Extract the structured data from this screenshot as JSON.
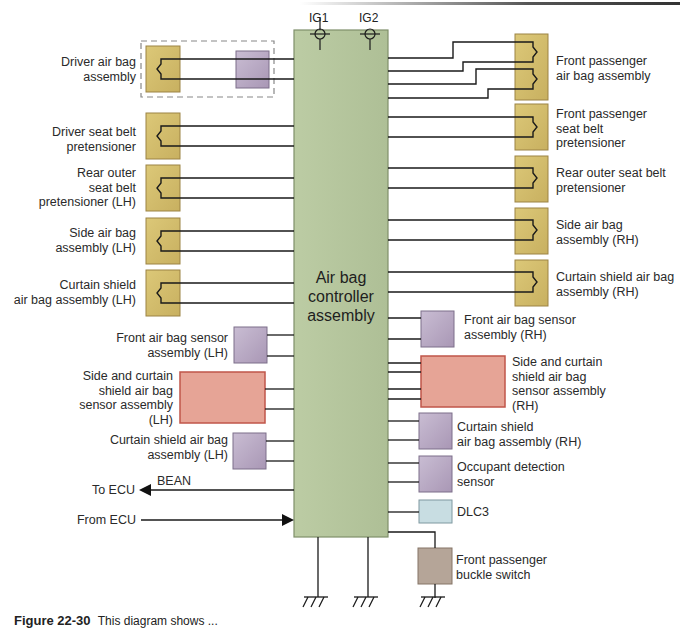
{
  "diagram": {
    "title": "Air bag controller assembly",
    "controller": {
      "label_lines": [
        "Air bag",
        "controller",
        "assembly"
      ],
      "color": "#b6c79d"
    },
    "power_inputs": [
      {
        "label": "IG1"
      },
      {
        "label": "IG2"
      }
    ],
    "left_components": [
      {
        "name": "driver-air-bag-assembly",
        "label_lines": [
          "Driver air bag",
          "assembly"
        ],
        "type": "squib",
        "note": "in dashed box with clock spring (purple)"
      },
      {
        "name": "driver-seat-belt-pretensioner",
        "label_lines": [
          "Driver seat belt",
          "pretensioner"
        ],
        "type": "squib"
      },
      {
        "name": "rear-outer-seat-belt-pretensioner-lh",
        "label_lines": [
          "Rear outer",
          "seat belt",
          "pretensioner (LH)"
        ],
        "type": "squib"
      },
      {
        "name": "side-air-bag-assembly-lh",
        "label_lines": [
          "Side air bag",
          "assembly (LH)"
        ],
        "type": "squib"
      },
      {
        "name": "curtain-shield-air-bag-assembly-lh",
        "label_lines": [
          "Curtain shield",
          "air bag assembly (LH)"
        ],
        "type": "squib"
      },
      {
        "name": "front-air-bag-sensor-assembly-lh",
        "label_lines": [
          "Front air bag sensor",
          "assembly (LH)"
        ],
        "type": "sensor"
      },
      {
        "name": "side-and-curtain-shield-air-bag-sensor-assembly-lh",
        "label_lines": [
          "Side and curtain",
          "shield air bag",
          "sensor assembly",
          "(LH)"
        ],
        "type": "large-sensor"
      },
      {
        "name": "curtain-shield-air-bag-assembly-lh-sensor",
        "label_lines": [
          "Curtain shield air bag",
          "assembly (LH)"
        ],
        "type": "sensor"
      }
    ],
    "right_components": [
      {
        "name": "front-passenger-air-bag-assembly",
        "label_lines": [
          "Front passenger",
          "air bag assembly"
        ],
        "type": "dual-squib"
      },
      {
        "name": "front-passenger-seat-belt-pretensioner",
        "label_lines": [
          "Front passenger",
          "seat belt",
          "pretensioner"
        ],
        "type": "squib"
      },
      {
        "name": "rear-outer-seat-belt-pretensioner-rh",
        "label_lines": [
          "Rear outer seat belt",
          "pretensioner"
        ],
        "type": "squib"
      },
      {
        "name": "side-air-bag-assembly-rh",
        "label_lines": [
          "Side air bag",
          "assembly (RH)"
        ],
        "type": "squib"
      },
      {
        "name": "curtain-shield-air-bag-assembly-rh",
        "label_lines": [
          "Curtain shield air bag",
          "assembly (RH)"
        ],
        "type": "squib"
      },
      {
        "name": "front-air-bag-sensor-assembly-rh",
        "label_lines": [
          "Front air bag sensor",
          "assembly (RH)"
        ],
        "type": "sensor"
      },
      {
        "name": "side-and-curtain-shield-air-bag-sensor-assembly-rh",
        "label_lines": [
          "Side and curtain",
          "shield air bag",
          "sensor assembly",
          "(RH)"
        ],
        "type": "large-sensor"
      },
      {
        "name": "curtain-shield-air-bag-assembly-rh-sensor",
        "label_lines": [
          "Curtain shield",
          "air bag assembly (RH)"
        ],
        "type": "sensor"
      },
      {
        "name": "occupant-detection-sensor",
        "label_lines": [
          "Occupant detection",
          "sensor"
        ],
        "type": "sensor"
      },
      {
        "name": "dlc3",
        "label_lines": [
          "DLC3"
        ],
        "type": "connector"
      },
      {
        "name": "front-passenger-buckle-switch",
        "label_lines": [
          "Front passenger",
          "buckle switch"
        ],
        "type": "switch"
      }
    ],
    "communication": {
      "to_ecu": "To ECU",
      "bus": "BEAN",
      "from_ecu": "From ECU"
    },
    "colors": {
      "squib": "#d2bc6c",
      "squib_border": "#9c8344",
      "sensor": "#bcaec8",
      "sensor_border": "#7d6f8a",
      "large_sensor": "#e8a79a",
      "large_sensor_border": "#c0564a",
      "connector": "#c8dde2",
      "switch": "#b5a598",
      "wire": "#1a1a1a"
    },
    "grounds": 3
  },
  "caption": {
    "figure": "Figure 22-30",
    "text": "This diagram shows ..."
  }
}
